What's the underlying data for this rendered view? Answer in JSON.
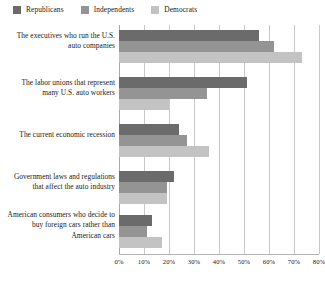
{
  "chart_data": {
    "type": "bar",
    "orientation": "horizontal",
    "title": "",
    "xlabel": "",
    "ylabel": "",
    "xlim": [
      0,
      80
    ],
    "xticks": [
      0,
      10,
      20,
      30,
      40,
      50,
      60,
      70,
      80
    ],
    "xtick_labels": [
      "0%",
      "10%",
      "20%",
      "30%",
      "40%",
      "50%",
      "60%",
      "70%",
      "80%"
    ],
    "grid": true,
    "legend_position": "top-left",
    "categories": [
      "The executives who run the U.S. auto companies",
      "The labor unions that represent many U.S. auto workers",
      "The current economic recession",
      "Government laws and regulations that affect the auto industry",
      "American consumers who decide to buy foreign cars rather than American cars"
    ],
    "series": [
      {
        "name": "Republicans",
        "color": "#6b6b6b",
        "values": [
          56,
          51,
          24,
          22,
          13
        ]
      },
      {
        "name": "Independents",
        "color": "#949494",
        "values": [
          62,
          35,
          27,
          19,
          11
        ]
      },
      {
        "name": "Democrats",
        "color": "#c3c3c3",
        "values": [
          73,
          20,
          36,
          19,
          17
        ]
      }
    ]
  }
}
